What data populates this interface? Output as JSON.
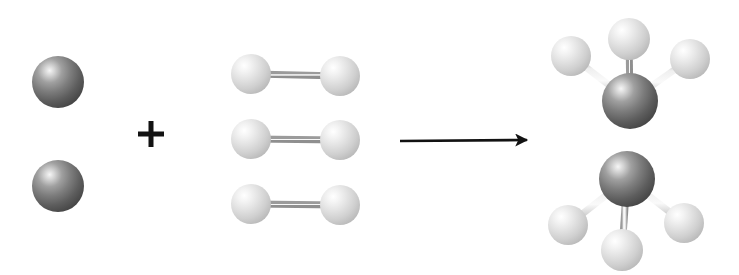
{
  "diagram": {
    "equation_text": "N2 + 3 H2 -> 2 NH3",
    "background_color": "#ffffff",
    "operators": {
      "plus_symbol": "+",
      "arrow_symbol": "→",
      "arrow_color": "#121212"
    },
    "atom_styles": {
      "dark_atom": {
        "label": "dark-sphere",
        "edge_color": "#4c4c4c",
        "mid_color": "#8a8a8a",
        "highlight_color": "#f4f4f4",
        "shadow_color": "#3a3a3a"
      },
      "light_atom": {
        "label": "light-sphere",
        "edge_color": "#bdbdbd",
        "mid_color": "#dcdcdc",
        "highlight_color": "#fdfdfd",
        "shadow_color": "#a8a8a8"
      },
      "bond": {
        "label": "cylindrical-bond",
        "edge_color": "#9a9a9a",
        "center_color": "#f2f2f2"
      }
    },
    "reactant_one": {
      "name": "diatomic-dark-molecule",
      "orientation": "vertical",
      "atom_count": 2,
      "atoms": [
        {
          "name": "dark-atom-top",
          "cx": 58,
          "cy": 82,
          "r": 26,
          "type": "dark"
        },
        {
          "name": "dark-atom-bottom",
          "cx": 58,
          "cy": 186,
          "r": 26,
          "type": "dark"
        }
      ],
      "bonds": [
        {
          "name": "bond-dark-dark",
          "x1": 58,
          "y1": 82,
          "x2": 58,
          "y2": 186,
          "width": 7
        }
      ]
    },
    "reactant_two": {
      "name": "diatomic-light-molecule-group",
      "orientation": "horizontal",
      "molecule_count": 3,
      "molecules": [
        {
          "name": "light-molecule-1",
          "atoms": [
            {
              "name": "light-atom-left",
              "cx": 251,
              "cy": 74,
              "r": 20,
              "type": "light"
            },
            {
              "name": "light-atom-right",
              "cx": 340,
              "cy": 76,
              "r": 20,
              "type": "light"
            }
          ],
          "bonds": [
            {
              "name": "bond-light-light",
              "x1": 251,
              "y1": 74,
              "x2": 340,
              "y2": 76,
              "width": 7
            }
          ]
        },
        {
          "name": "light-molecule-2",
          "atoms": [
            {
              "name": "light-atom-left",
              "cx": 251,
              "cy": 139,
              "r": 20,
              "type": "light"
            },
            {
              "name": "light-atom-right",
              "cx": 340,
              "cy": 140,
              "r": 20,
              "type": "light"
            }
          ],
          "bonds": [
            {
              "name": "bond-light-light",
              "x1": 251,
              "y1": 139,
              "x2": 340,
              "y2": 140,
              "width": 7
            }
          ]
        },
        {
          "name": "light-molecule-3",
          "atoms": [
            {
              "name": "light-atom-left",
              "cx": 251,
              "cy": 204,
              "r": 20,
              "type": "light"
            },
            {
              "name": "light-atom-right",
              "cx": 340,
              "cy": 205,
              "r": 20,
              "type": "light"
            }
          ],
          "bonds": [
            {
              "name": "bond-light-light",
              "x1": 251,
              "y1": 204,
              "x2": 340,
              "y2": 205,
              "width": 7
            }
          ]
        }
      ]
    },
    "plus_sign": {
      "name": "plus-operator",
      "cx": 151,
      "cy": 134,
      "arm": 13,
      "thickness": 5
    },
    "arrow": {
      "name": "reaction-arrow",
      "x1": 400,
      "y1": 141,
      "x2": 535,
      "y2": 140,
      "head_length": 18,
      "head_width": 11,
      "shaft_width": 2.6
    },
    "products": [
      {
        "name": "product-molecule-upper",
        "orientation": "apex-down",
        "central_atom": {
          "name": "dark-central-atom",
          "cx": 630,
          "cy": 101,
          "r": 28,
          "type": "dark"
        },
        "ligands": [
          {
            "name": "light-atom-upper-left",
            "cx": 571,
            "cy": 56,
            "r": 20,
            "type": "light"
          },
          {
            "name": "light-atom-top",
            "cx": 629,
            "cy": 39,
            "r": 21,
            "type": "light"
          },
          {
            "name": "light-atom-upper-right",
            "cx": 690,
            "cy": 59,
            "r": 20,
            "type": "light"
          }
        ],
        "bonds": [
          {
            "name": "bond-center-upper-left",
            "x1": 630,
            "y1": 101,
            "x2": 571,
            "y2": 56,
            "width": 7
          },
          {
            "name": "bond-center-top",
            "x1": 630,
            "y1": 101,
            "x2": 629,
            "y2": 39,
            "width": 7
          },
          {
            "name": "bond-center-upper-right",
            "x1": 630,
            "y1": 101,
            "x2": 690,
            "y2": 59,
            "width": 7
          }
        ]
      },
      {
        "name": "product-molecule-lower",
        "orientation": "apex-up",
        "central_atom": {
          "name": "dark-central-atom",
          "cx": 627,
          "cy": 179,
          "r": 28,
          "type": "dark"
        },
        "ligands": [
          {
            "name": "light-atom-lower-left",
            "cx": 568,
            "cy": 225,
            "r": 20,
            "type": "light"
          },
          {
            "name": "light-atom-bottom",
            "cx": 622,
            "cy": 250,
            "r": 21,
            "type": "light"
          },
          {
            "name": "light-atom-lower-right",
            "cx": 684,
            "cy": 223,
            "r": 20,
            "type": "light"
          }
        ],
        "bonds": [
          {
            "name": "bond-center-lower-left",
            "x1": 627,
            "y1": 179,
            "x2": 568,
            "y2": 225,
            "width": 7
          },
          {
            "name": "bond-center-bottom",
            "x1": 627,
            "y1": 179,
            "x2": 622,
            "y2": 250,
            "width": 7
          },
          {
            "name": "bond-center-lower-right",
            "x1": 627,
            "y1": 179,
            "x2": 684,
            "y2": 223,
            "width": 7
          }
        ]
      }
    ]
  }
}
